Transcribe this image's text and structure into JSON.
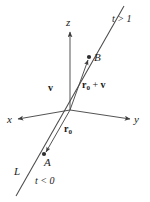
{
  "figure": {
    "background_color": "#ffffff",
    "stroke_color": "#4a4a4a",
    "text_color": "#1a1a1a",
    "axes": [
      {
        "name": "x",
        "label": "x",
        "direction": "left"
      },
      {
        "name": "y",
        "label": "y",
        "direction": "right"
      },
      {
        "name": "z",
        "label": "z",
        "direction": "up"
      }
    ],
    "points": [
      {
        "name": "A",
        "label": "A"
      },
      {
        "name": "B",
        "label": "B"
      }
    ],
    "vectors": [
      {
        "name": "v",
        "label_base": "v",
        "label_sub": "",
        "label_suffix": ""
      },
      {
        "name": "r0",
        "label_base": "r",
        "label_sub": "0",
        "label_suffix": ""
      },
      {
        "name": "r0_plus_v",
        "label_base": "r",
        "label_sub": "0",
        "label_suffix": " + v"
      }
    ],
    "annotations": [
      {
        "name": "t-greater-than-one",
        "text": "t > 1"
      },
      {
        "name": "t-less-than-zero",
        "text": "t < 0"
      },
      {
        "name": "line-name",
        "text": "L"
      }
    ],
    "vector_v_label": "v",
    "vector_r0_base": "r",
    "vector_r0_sub": "0",
    "vector_sum_base": "r",
    "vector_sum_sub": "0",
    "vector_sum_op": " + ",
    "vector_sum_second": "v",
    "axis_x_label": "x",
    "axis_y_label": "y",
    "axis_z_label": "z",
    "point_a_label": "A",
    "point_b_label": "B",
    "line_label": "L",
    "t_upper_label": "t > 1",
    "t_lower_label": "t < 0"
  }
}
